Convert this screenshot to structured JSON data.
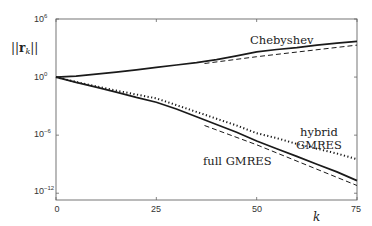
{
  "chart_data": {
    "type": "line",
    "title": "",
    "xlabel": "k",
    "ylabel": "||r_k||",
    "ylabel_parts": {
      "bars_left": "||",
      "symbol": "r",
      "subscript": "k",
      "bars_right": "||"
    },
    "yscale": "log",
    "xlim": [
      0,
      75
    ],
    "ylim_log10": [
      -12.7,
      6
    ],
    "x_ticks": [
      0,
      25,
      50,
      75
    ],
    "x_tick_labels": [
      "0",
      "25",
      "50",
      "75"
    ],
    "y_ticks_log10": [
      6,
      0,
      -6,
      -12
    ],
    "y_tick_labels": [
      {
        "base": "10",
        "exp": "6"
      },
      {
        "base": "10",
        "exp": "0"
      },
      {
        "base": "10",
        "exp": "−6"
      },
      {
        "base": "10",
        "exp": "−12"
      }
    ],
    "grid": false,
    "legend": "none (inline curve labels)",
    "series": [
      {
        "name": "Chebyshev",
        "style": "solid",
        "x": [
          0,
          5,
          10,
          15,
          20,
          25,
          30,
          35,
          40,
          45,
          50,
          55,
          60,
          65,
          70,
          75
        ],
        "log10_y": [
          0,
          0.1,
          0.3,
          0.5,
          0.75,
          1.0,
          1.25,
          1.5,
          1.8,
          2.2,
          2.6,
          2.85,
          3.05,
          3.3,
          3.5,
          3.7
        ]
      },
      {
        "name": "Chebyshev asymptote",
        "style": "dashed",
        "x": [
          37,
          50,
          75
        ],
        "log10_y": [
          1.4,
          2.1,
          3.3
        ]
      },
      {
        "name": "hybrid GMRES",
        "style": "dotted",
        "x": [
          0,
          5,
          10,
          15,
          20,
          25,
          30,
          35,
          40,
          45,
          50,
          55,
          60,
          65,
          70,
          75
        ],
        "log10_y": [
          0,
          -0.5,
          -0.95,
          -1.4,
          -1.8,
          -2.2,
          -2.9,
          -3.6,
          -4.3,
          -5.0,
          -5.8,
          -6.3,
          -6.9,
          -7.4,
          -7.9,
          -8.5
        ]
      },
      {
        "name": "full GMRES",
        "style": "solid",
        "x": [
          0,
          5,
          10,
          15,
          20,
          25,
          30,
          35,
          40,
          45,
          50,
          55,
          60,
          65,
          70,
          75
        ],
        "log10_y": [
          0,
          -0.55,
          -1.05,
          -1.55,
          -2.1,
          -2.6,
          -3.3,
          -4.1,
          -4.9,
          -5.7,
          -6.6,
          -7.4,
          -8.2,
          -9.0,
          -9.8,
          -10.7
        ]
      },
      {
        "name": "full GMRES asymptote",
        "style": "dashed",
        "x": [
          37,
          50,
          75
        ],
        "log10_y": [
          -5.0,
          -7.0,
          -11.2
        ]
      }
    ],
    "annotations": [
      {
        "text": "Chebyshev",
        "near": "upper curve, k≈50-60"
      },
      {
        "text": "hybrid\nGMRES",
        "near": "dotted curve, k≈60-70"
      },
      {
        "text": "full GMRES",
        "near": "solid lower curve, k≈40-50"
      }
    ]
  },
  "labels": {
    "chebyshev": "Chebyshev",
    "hybrid_line1": "hybrid",
    "hybrid_line2": "GMRES",
    "full_gmres": "full GMRES",
    "xlabel": "k",
    "ylabel_bars": "||",
    "ylabel_r": "r",
    "ylabel_sub": "k",
    "x_ticks": [
      "0",
      "25",
      "50",
      "75"
    ],
    "y_ticks": [
      {
        "base": "10",
        "exp": "6"
      },
      {
        "base": "10",
        "exp": "0"
      },
      {
        "base": "10",
        "exp": "−6"
      },
      {
        "base": "10",
        "exp": "−12"
      }
    ]
  },
  "colors": {
    "line": "#1a1a1a",
    "axes": "#555555",
    "background": "#ffffff"
  }
}
